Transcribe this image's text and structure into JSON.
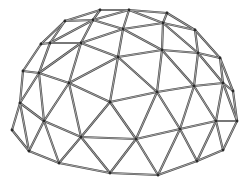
{
  "image": {
    "subject": "geodesic dome wireframe",
    "background": "#ffffff",
    "strut_color": "#4a4a4a",
    "strut_highlight": "#bdbdbd",
    "hub_color": "#2a2a2a"
  },
  "nodes": {
    "A": [
      100,
      10
    ],
    "B": [
      129,
      10
    ],
    "C": [
      167,
      13
    ],
    "D": [
      65,
      21
    ],
    "E": [
      93,
      20
    ],
    "F": [
      123,
      29
    ],
    "G": [
      163,
      23
    ],
    "H": [
      195,
      30
    ],
    "I": [
      41,
      44
    ],
    "J": [
      50,
      43
    ],
    "K": [
      81,
      43
    ],
    "L": [
      118,
      57
    ],
    "M": [
      162,
      50
    ],
    "N": [
      198,
      53
    ],
    "O": [
      220,
      58
    ],
    "P": [
      23,
      71
    ],
    "Q": [
      39,
      73
    ],
    "R": [
      69,
      83
    ],
    "S": [
      110,
      102
    ],
    "T": [
      157,
      92
    ],
    "U": [
      194,
      86
    ],
    "V": [
      223,
      83
    ],
    "W": [
      233,
      91
    ],
    "X": [
      20,
      103
    ],
    "Y": [
      44,
      121
    ],
    "Z": [
      12,
      130
    ],
    "a": [
      81,
      137
    ],
    "b": [
      136,
      139
    ],
    "c": [
      180,
      129
    ],
    "d": [
      216,
      121
    ],
    "e": [
      237,
      121
    ],
    "f": [
      29,
      151
    ],
    "g": [
      59,
      163
    ],
    "h": [
      110,
      173
    ],
    "i": [
      158,
      175
    ],
    "j": [
      197,
      161
    ],
    "k": [
      223,
      150
    ]
  },
  "edges": [
    [
      "A",
      "B"
    ],
    [
      "B",
      "C"
    ],
    [
      "C",
      "H"
    ],
    [
      "A",
      "D"
    ],
    [
      "A",
      "E"
    ],
    [
      "B",
      "E"
    ],
    [
      "B",
      "F"
    ],
    [
      "B",
      "G"
    ],
    [
      "C",
      "G"
    ],
    [
      "D",
      "E"
    ],
    [
      "E",
      "F"
    ],
    [
      "F",
      "G"
    ],
    [
      "G",
      "H"
    ],
    [
      "H",
      "O"
    ],
    [
      "D",
      "J"
    ],
    [
      "D",
      "I"
    ],
    [
      "E",
      "K"
    ],
    [
      "E",
      "J"
    ],
    [
      "J",
      "K"
    ],
    [
      "K",
      "F"
    ],
    [
      "F",
      "L"
    ],
    [
      "L",
      "K"
    ],
    [
      "F",
      "M"
    ],
    [
      "G",
      "M"
    ],
    [
      "G",
      "N"
    ],
    [
      "H",
      "N"
    ],
    [
      "M",
      "N"
    ],
    [
      "N",
      "O"
    ],
    [
      "L",
      "M"
    ],
    [
      "I",
      "J"
    ],
    [
      "I",
      "P"
    ],
    [
      "J",
      "Q"
    ],
    [
      "Q",
      "K"
    ],
    [
      "K",
      "R"
    ],
    [
      "P",
      "Q"
    ],
    [
      "Q",
      "R"
    ],
    [
      "R",
      "L"
    ],
    [
      "L",
      "S"
    ],
    [
      "R",
      "S"
    ],
    [
      "L",
      "T"
    ],
    [
      "M",
      "T"
    ],
    [
      "T",
      "U"
    ],
    [
      "M",
      "U"
    ],
    [
      "U",
      "N"
    ],
    [
      "N",
      "V"
    ],
    [
      "O",
      "V"
    ],
    [
      "O",
      "W"
    ],
    [
      "V",
      "W"
    ],
    [
      "U",
      "V"
    ],
    [
      "P",
      "X"
    ],
    [
      "Q",
      "X"
    ],
    [
      "X",
      "Z"
    ],
    [
      "Q",
      "Y"
    ],
    [
      "R",
      "Y"
    ],
    [
      "Y",
      "X"
    ],
    [
      "S",
      "a"
    ],
    [
      "R",
      "a"
    ],
    [
      "Y",
      "a"
    ],
    [
      "S",
      "b"
    ],
    [
      "S",
      "T"
    ],
    [
      "T",
      "b"
    ],
    [
      "T",
      "c"
    ],
    [
      "U",
      "c"
    ],
    [
      "c",
      "d"
    ],
    [
      "U",
      "d"
    ],
    [
      "V",
      "d"
    ],
    [
      "W",
      "e"
    ],
    [
      "d",
      "e"
    ],
    [
      "V",
      "e"
    ],
    [
      "Z",
      "f"
    ],
    [
      "X",
      "f"
    ],
    [
      "Y",
      "f"
    ],
    [
      "Y",
      "g"
    ],
    [
      "a",
      "g"
    ],
    [
      "f",
      "g"
    ],
    [
      "a",
      "h"
    ],
    [
      "g",
      "h"
    ],
    [
      "a",
      "b"
    ],
    [
      "b",
      "h"
    ],
    [
      "b",
      "i"
    ],
    [
      "h",
      "i"
    ],
    [
      "b",
      "c"
    ],
    [
      "c",
      "i"
    ],
    [
      "c",
      "j"
    ],
    [
      "d",
      "j"
    ],
    [
      "i",
      "j"
    ],
    [
      "j",
      "k"
    ],
    [
      "d",
      "k"
    ],
    [
      "e",
      "k"
    ]
  ]
}
